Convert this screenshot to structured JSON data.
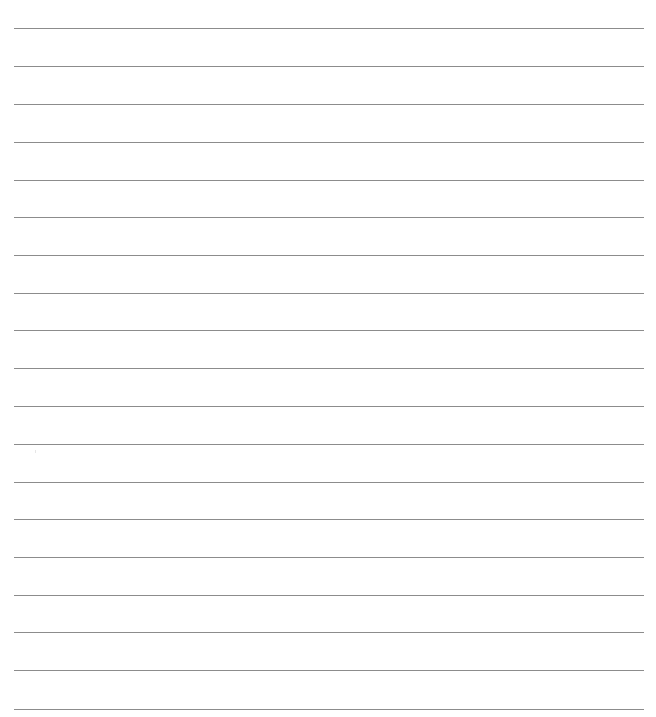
{
  "page": {
    "type": "lined-paper",
    "background_color": "#ffffff",
    "line_color": "#8c8c8c",
    "line_count": 19,
    "line_left": 14,
    "line_width": 630,
    "lines_y": [
      28,
      66,
      104,
      142,
      180,
      217,
      255,
      293,
      330,
      368,
      406,
      444,
      482,
      519,
      557,
      595,
      632,
      670,
      709
    ]
  }
}
